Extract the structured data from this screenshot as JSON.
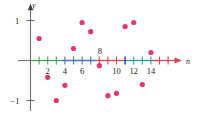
{
  "chart_data": {
    "type": "scatter",
    "title": "",
    "subtitle": "",
    "xlabel": "n",
    "ylabel": "y",
    "xlim": [
      0,
      15.8
    ],
    "ylim": [
      -1.35,
      1.3
    ],
    "grid": false,
    "legend": null,
    "x": [
      1,
      2,
      3,
      4,
      5,
      6,
      7,
      8,
      9,
      10,
      11,
      12,
      13,
      14
    ],
    "values": [
      0.55,
      -0.42,
      -1.0,
      -0.62,
      0.3,
      0.95,
      0.72,
      -0.13,
      -0.88,
      -0.82,
      0.85,
      0.95,
      -0.6,
      0.2
    ],
    "points": [
      {
        "n": 1,
        "y": 0.55
      },
      {
        "n": 2,
        "y": -0.42
      },
      {
        "n": 3,
        "y": -1.0
      },
      {
        "n": 4,
        "y": -0.62
      },
      {
        "n": 5,
        "y": 0.3
      },
      {
        "n": 6,
        "y": 0.95
      },
      {
        "n": 7,
        "y": 0.72
      },
      {
        "n": 8,
        "y": -0.13
      },
      {
        "n": 9,
        "y": -0.88
      },
      {
        "n": 10,
        "y": -0.82
      },
      {
        "n": 11,
        "y": 0.85
      },
      {
        "n": 12,
        "y": 0.95
      },
      {
        "n": 13,
        "y": -0.6
      },
      {
        "n": 14,
        "y": 0.2
      }
    ],
    "x_tick_values": [
      1,
      2,
      3,
      4,
      5,
      6,
      7,
      8,
      9,
      10,
      11,
      12,
      13,
      14,
      15
    ],
    "x_tick_labels_shown": [
      "2",
      "4",
      "6",
      "8",
      "10",
      "12",
      "14"
    ],
    "x_labeled_ticks": [
      {
        "value": 2,
        "label": "2",
        "position": "below"
      },
      {
        "value": 4,
        "label": "4",
        "position": "below"
      },
      {
        "value": 6,
        "label": "6",
        "position": "below"
      },
      {
        "value": 8,
        "label": "8",
        "position": "above"
      },
      {
        "value": 10,
        "label": "10",
        "position": "below"
      },
      {
        "value": 12,
        "label": "12",
        "position": "below"
      },
      {
        "value": 14,
        "label": "14",
        "position": "below"
      }
    ],
    "y_tick_values": [
      1,
      -1
    ],
    "y_tick_labels": [
      "1",
      "−1"
    ],
    "colors": {
      "point": "#e8356d",
      "axis": "#58595b",
      "tick_red": "#e0404a",
      "tick_green": "#3aa655",
      "tick_blue": "#3a6fb0",
      "tick_teal": "#2e9c9c",
      "tick_purple": "#7b4ea0",
      "text": "#231f20"
    }
  }
}
